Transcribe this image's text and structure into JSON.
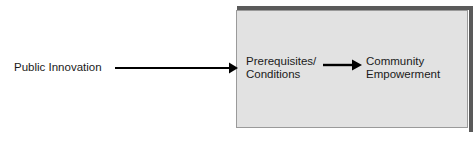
{
  "diagram": {
    "title_present": false,
    "background_color": "#ffffff",
    "input_label": "Public Innovation",
    "container": {
      "fill_color": "#e2e2e2",
      "border_color": "#9a9a9a",
      "shadow_color": "#5a5a5a"
    },
    "nodes": [
      {
        "id": "prerequisites",
        "line1": "Prerequisites/",
        "line2": "Conditions"
      },
      {
        "id": "community",
        "line1": "Community",
        "line2": "Empowerment"
      }
    ],
    "arrows": [
      {
        "id": "main-arrow",
        "icon": "arrow-right-icon",
        "from": "Public Innovation",
        "to": "Prerequisites/Conditions",
        "color": "#000000"
      },
      {
        "id": "inner-arrow",
        "icon": "arrow-right-icon",
        "from": "Prerequisites/Conditions",
        "to": "Community Empowerment",
        "color": "#000000"
      }
    ]
  }
}
